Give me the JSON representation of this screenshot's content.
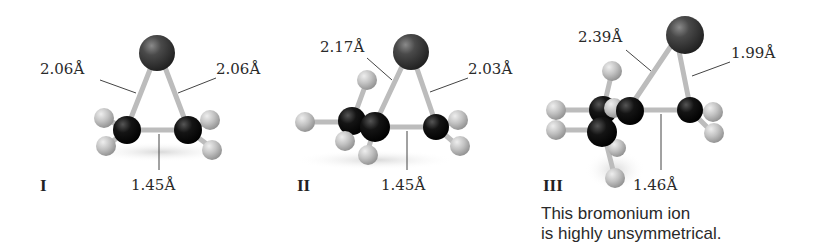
{
  "structures": [
    {
      "roman": "I",
      "bond_left": "2.06Å",
      "bond_right": "2.06Å",
      "bond_cc": "1.45Å"
    },
    {
      "roman": "II",
      "bond_left": "2.17Å",
      "bond_right": "2.03Å",
      "bond_cc": "1.45Å"
    },
    {
      "roman": "III",
      "bond_left": "2.39Å",
      "bond_right": "1.99Å",
      "bond_cc": "1.46Å"
    }
  ],
  "caption": {
    "line1": "This bromonium ion",
    "line2": "is highly unsymmetrical."
  },
  "colors": {
    "bromine": "#3a3a3a",
    "carbon": "#111111",
    "hydrogen": "#bdbdbd",
    "bond": "#c8c8c8",
    "leader": "#444444"
  }
}
